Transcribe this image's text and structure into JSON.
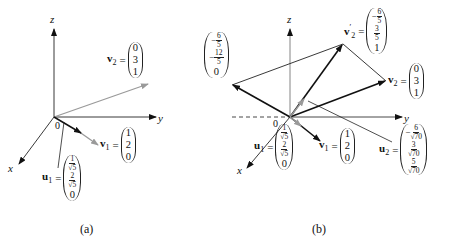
{
  "panel_a": {
    "caption": "(a)",
    "axes": {
      "x": "x",
      "y": "y",
      "z": "z",
      "origin": "0"
    },
    "vectors": {
      "v2": {
        "name": "v",
        "sub": "2",
        "eq": "=",
        "entries": [
          "0",
          "3",
          "1"
        ]
      },
      "v1": {
        "name": "v",
        "sub": "1",
        "eq": "=",
        "entries": [
          "1",
          "2",
          "0"
        ]
      },
      "u1": {
        "name": "u",
        "sub": "1",
        "eq": "=",
        "entries": [
          {
            "num": "1",
            "den": "√5"
          },
          {
            "num": "2",
            "den": "√5"
          },
          "0"
        ]
      }
    }
  },
  "panel_b": {
    "caption": "(b)",
    "axes": {
      "x": "x",
      "y": "y",
      "z": "z",
      "origin": "0"
    },
    "vectors": {
      "proj": {
        "entries": [
          {
            "sign": "−",
            "num": "6",
            "den": "5"
          },
          {
            "sign": "−",
            "num": "12",
            "den": "5"
          },
          "0"
        ]
      },
      "v2prime": {
        "name": "v",
        "sub": "2",
        "prime": "′",
        "eq": "=",
        "entries": [
          {
            "sign": "−",
            "num": "6",
            "den": "5"
          },
          {
            "num": "3",
            "den": "5"
          },
          "1"
        ]
      },
      "v2": {
        "name": "v",
        "sub": "2",
        "eq": "=",
        "entries": [
          "0",
          "3",
          "1"
        ]
      },
      "v1": {
        "name": "v",
        "sub": "1",
        "eq": "=",
        "entries": [
          "1",
          "2",
          "0"
        ]
      },
      "u1": {
        "name": "u",
        "sub": "1",
        "eq": "=",
        "entries": [
          {
            "num": "1",
            "den": "√5"
          },
          {
            "num": "2",
            "den": "√5"
          },
          "0"
        ]
      },
      "u2": {
        "name": "u",
        "sub": "2",
        "eq": "=",
        "entries": [
          {
            "sign": "−",
            "num": "6",
            "den": "√70"
          },
          {
            "num": "3",
            "den": "√70"
          },
          {
            "num": "5",
            "den": "√70"
          }
        ]
      }
    }
  },
  "colors": {
    "ink": "#111111",
    "gray_vector": "#9a9a9a",
    "axis": "#222222"
  }
}
